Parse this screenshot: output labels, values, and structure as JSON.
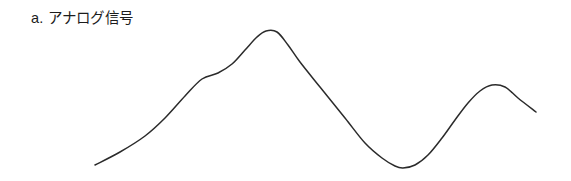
{
  "figure": {
    "caption": "a. アナログ信号",
    "background_color": "#ffffff",
    "stroke_color": "#2b2b2b",
    "stroke_width": 1.5
  },
  "chart_data": {
    "type": "line",
    "title": "a. アナログ信号",
    "subtitle": "",
    "xlabel": "",
    "ylabel": "",
    "xlim": [
      95,
      536
    ],
    "ylim": [
      31,
      168
    ],
    "grid": false,
    "legend": null,
    "axis_ticks": {
      "x": [],
      "y": []
    },
    "annotations": [],
    "series": [
      {
        "name": "analog-signal",
        "color": "#2b2b2b",
        "points": [
          [
            95,
            165
          ],
          [
            120,
            152
          ],
          [
            145,
            136
          ],
          [
            165,
            118
          ],
          [
            185,
            96
          ],
          [
            202,
            79
          ],
          [
            218,
            73
          ],
          [
            232,
            64
          ],
          [
            245,
            50
          ],
          [
            257,
            37
          ],
          [
            266,
            31
          ],
          [
            277,
            32
          ],
          [
            288,
            45
          ],
          [
            300,
            62
          ],
          [
            320,
            87
          ],
          [
            345,
            118
          ],
          [
            365,
            143
          ],
          [
            382,
            158
          ],
          [
            395,
            166
          ],
          [
            403,
            168
          ],
          [
            415,
            165
          ],
          [
            428,
            155
          ],
          [
            442,
            138
          ],
          [
            455,
            120
          ],
          [
            468,
            103
          ],
          [
            480,
            91
          ],
          [
            492,
            85
          ],
          [
            505,
            87
          ],
          [
            518,
            98
          ],
          [
            536,
            112
          ]
        ],
        "key_features": [
          {
            "label": "start",
            "x": 95,
            "y": 165
          },
          {
            "label": "shoulder-inflection",
            "x": 210,
            "y": 76
          },
          {
            "label": "main-peak",
            "x": 266,
            "y": 31
          },
          {
            "label": "trough",
            "x": 403,
            "y": 168
          },
          {
            "label": "secondary-peak",
            "x": 492,
            "y": 85
          },
          {
            "label": "end",
            "x": 536,
            "y": 112
          }
        ]
      }
    ]
  }
}
